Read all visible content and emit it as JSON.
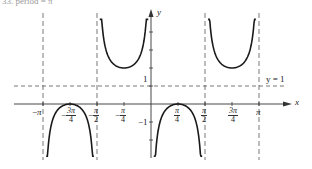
{
  "caption": "33. period = π",
  "chart_data": {
    "type": "line",
    "title": "",
    "function": "y = 1 − csc 2x",
    "xlabel": "x",
    "ylabel": "y",
    "xlim": [
      -3.3,
      3.75
    ],
    "ylim": [
      -2.9,
      5.2
    ],
    "grid": false,
    "x_ticks": [
      {
        "value": -3.14159,
        "sign": "−",
        "num": "π",
        "den": ""
      },
      {
        "value": -2.35619,
        "sign": "−",
        "num": "3π",
        "den": "4"
      },
      {
        "value": -1.5708,
        "sign": "−",
        "num": "π",
        "den": "2"
      },
      {
        "value": -0.7854,
        "sign": "−",
        "num": "π",
        "den": "4"
      },
      {
        "value": 0.7854,
        "sign": "",
        "num": "π",
        "den": "4"
      },
      {
        "value": 1.5708,
        "sign": "",
        "num": "π",
        "den": "2"
      },
      {
        "value": 2.35619,
        "sign": "",
        "num": "3π",
        "den": "4"
      },
      {
        "value": 3.14159,
        "sign": "",
        "num": "π",
        "den": ""
      }
    ],
    "y_ticks": [
      -2,
      -1,
      1,
      2,
      3,
      4
    ],
    "y_tick_labels": [
      {
        "value": 1,
        "text": "1"
      },
      {
        "value": -1,
        "text": "−1"
      }
    ],
    "asymptotes_x": [
      -3.14159,
      -1.5708,
      1.5708,
      3.14159
    ],
    "reference_lines": [
      {
        "y": 1,
        "label": "y = 1",
        "style": "dashed"
      }
    ],
    "branches": [
      {
        "name": "lower-branch-left",
        "x_from": -3.05,
        "x_to": -1.66,
        "extremum": {
          "x": -2.35619,
          "y": 0
        },
        "opens": "down"
      },
      {
        "name": "upper-branch-left",
        "x_from": -1.49,
        "x_to": -0.08,
        "extremum": {
          "x": -0.7854,
          "y": 2
        },
        "opens": "up"
      },
      {
        "name": "lower-branch-right",
        "x_from": 0.08,
        "x_to": 1.49,
        "extremum": {
          "x": 0.7854,
          "y": 0
        },
        "opens": "down"
      },
      {
        "name": "upper-branch-right",
        "x_from": 1.66,
        "x_to": 3.05,
        "extremum": {
          "x": 2.35619,
          "y": 2
        },
        "opens": "up"
      }
    ],
    "colors": {
      "curve": "#1a1a1a",
      "axis": "#333333",
      "dashed": "#555555"
    }
  }
}
